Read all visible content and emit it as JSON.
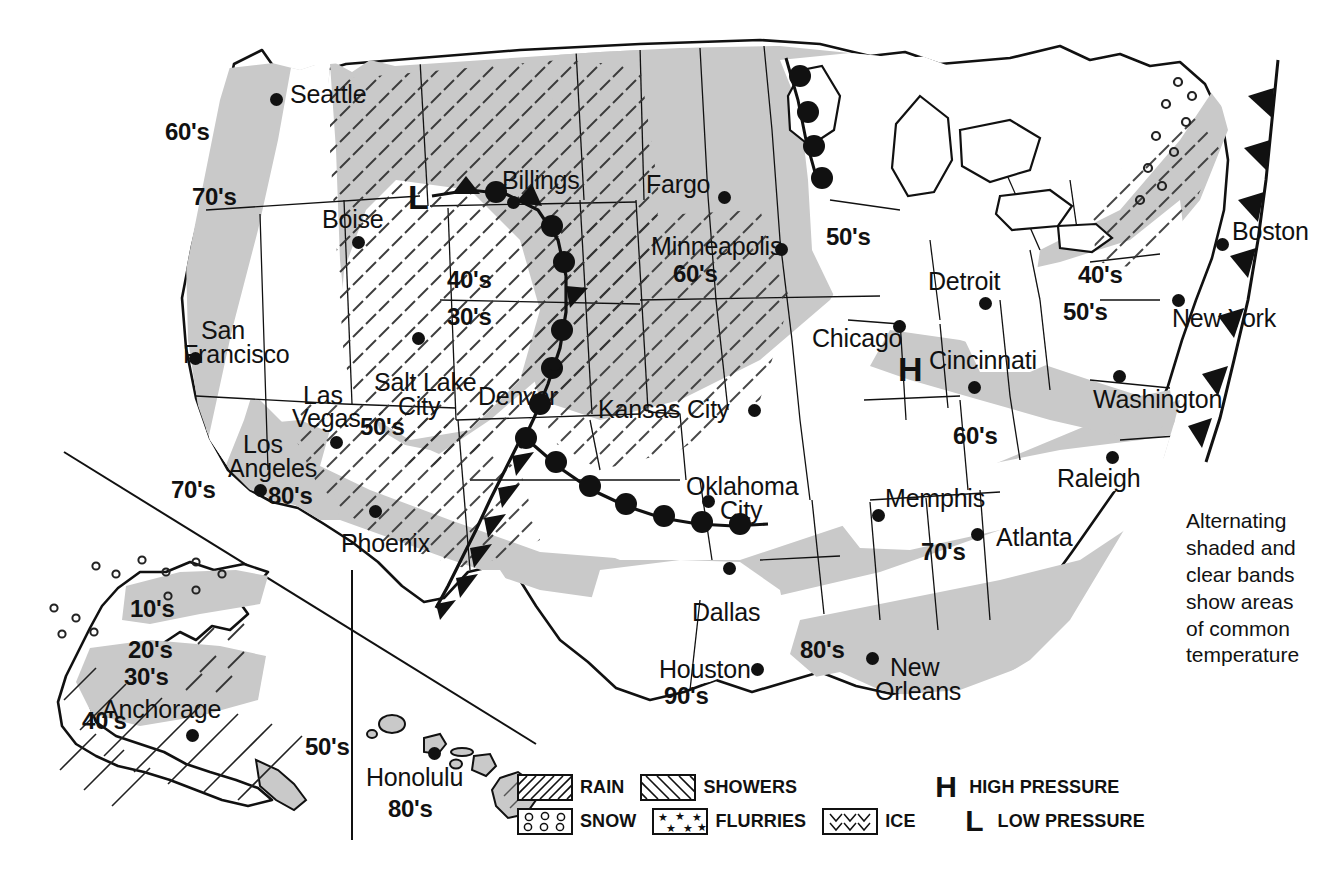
{
  "map": {
    "title": "USA Weather Map",
    "cities": [
      {
        "name": "Seattle",
        "label_x": 290,
        "label_y": 82,
        "dot_x": 270,
        "dot_y": 93
      },
      {
        "name": "Boise",
        "label_x": 322,
        "label_y": 207,
        "dot_x": 352,
        "dot_y": 236
      },
      {
        "name": "Billings",
        "label_x": 502,
        "label_y": 168,
        "dot_x": 507,
        "dot_y": 196
      },
      {
        "name": "Fargo",
        "label_x": 646,
        "label_y": 172,
        "dot_x": 718,
        "dot_y": 191
      },
      {
        "name": "Minneapolis",
        "label_x": 651,
        "label_y": 234,
        "dot_x": 775,
        "dot_y": 243
      },
      {
        "name": "Detroit",
        "label_x": 928,
        "label_y": 269,
        "dot_x": 979,
        "dot_y": 297
      },
      {
        "name": "Boston",
        "label_x": 1232,
        "label_y": 219,
        "dot_x": 1216,
        "dot_y": 238
      },
      {
        "name": "New York",
        "label_x": 1172,
        "label_y": 306,
        "dot_x": 1172,
        "dot_y": 294
      },
      {
        "name": "Chicago",
        "label_x": 812,
        "label_y": 326,
        "dot_x": 893,
        "dot_y": 320
      },
      {
        "name": "Cincinnati",
        "label_x": 929,
        "label_y": 348,
        "dot_x": 968,
        "dot_y": 381
      },
      {
        "name": "Washington",
        "label_x": 1093,
        "label_y": 387,
        "dot_x": 1113,
        "dot_y": 370
      },
      {
        "name": "San",
        "label_x": 201,
        "label_y": 318,
        "dot_x": 189,
        "dot_y": 352
      },
      {
        "name": "Francisco",
        "label_x": 183,
        "label_y": 342,
        "dot_x": null,
        "dot_y": null
      },
      {
        "name": "Salt Lake",
        "label_x": 374,
        "label_y": 370,
        "dot_x": 412,
        "dot_y": 332
      },
      {
        "name": "City",
        "label_x": 398,
        "label_y": 394,
        "dot_x": null,
        "dot_y": null
      },
      {
        "name": "Denver",
        "label_x": 478,
        "label_y": 384,
        "dot_x": 548,
        "dot_y": 358
      },
      {
        "name": "Kansas City",
        "label_x": 598,
        "label_y": 397,
        "dot_x": 748,
        "dot_y": 404
      },
      {
        "name": "Las",
        "label_x": 303,
        "label_y": 383,
        "dot_x": 330,
        "dot_y": 436
      },
      {
        "name": "Vegas",
        "label_x": 292,
        "label_y": 406,
        "dot_x": null,
        "dot_y": null
      },
      {
        "name": "Los",
        "label_x": 243,
        "label_y": 432,
        "dot_x": 254,
        "dot_y": 484
      },
      {
        "name": "Angeles",
        "label_x": 228,
        "label_y": 456,
        "dot_x": null,
        "dot_y": null
      },
      {
        "name": "Phoenix",
        "label_x": 341,
        "label_y": 531,
        "dot_x": 369,
        "dot_y": 505
      },
      {
        "name": "Oklahoma",
        "label_x": 686,
        "label_y": 474,
        "dot_x": 702,
        "dot_y": 495
      },
      {
        "name": "City",
        "label_x": 720,
        "label_y": 498,
        "dot_x": null,
        "dot_y": null
      },
      {
        "name": "Memphis",
        "label_x": 885,
        "label_y": 486,
        "dot_x": 872,
        "dot_y": 509
      },
      {
        "name": "Raleigh",
        "label_x": 1057,
        "label_y": 466,
        "dot_x": 1106,
        "dot_y": 451
      },
      {
        "name": "Atlanta",
        "label_x": 996,
        "label_y": 525,
        "dot_x": 971,
        "dot_y": 528
      },
      {
        "name": "Dallas",
        "label_x": 692,
        "label_y": 600,
        "dot_x": 723,
        "dot_y": 562
      },
      {
        "name": "Houston",
        "label_x": 659,
        "label_y": 657,
        "dot_x": 751,
        "dot_y": 663
      },
      {
        "name": "New",
        "label_x": 890,
        "label_y": 655,
        "dot_x": 866,
        "dot_y": 652
      },
      {
        "name": "Orleans",
        "label_x": 875,
        "label_y": 679,
        "dot_x": null,
        "dot_y": null
      },
      {
        "name": "Anchorage",
        "label_x": 102,
        "label_y": 697,
        "dot_x": 186,
        "dot_y": 729
      },
      {
        "name": "Honolulu",
        "label_x": 366,
        "label_y": 765,
        "dot_x": 428,
        "dot_y": 747
      }
    ],
    "temperature_bands": [
      {
        "value": "60's",
        "x": 165,
        "y": 120
      },
      {
        "value": "70's",
        "x": 192,
        "y": 185
      },
      {
        "value": "40's",
        "x": 447,
        "y": 268
      },
      {
        "value": "30's",
        "x": 447,
        "y": 305
      },
      {
        "value": "50's",
        "x": 826,
        "y": 225
      },
      {
        "value": "60's",
        "x": 673,
        "y": 262
      },
      {
        "value": "40's",
        "x": 1078,
        "y": 263
      },
      {
        "value": "50's",
        "x": 1063,
        "y": 300
      },
      {
        "value": "50's",
        "x": 360,
        "y": 415
      },
      {
        "value": "60's",
        "x": 953,
        "y": 424
      },
      {
        "value": "70's",
        "x": 171,
        "y": 478
      },
      {
        "value": "80's",
        "x": 268,
        "y": 484
      },
      {
        "value": "70's",
        "x": 921,
        "y": 540
      },
      {
        "value": "80's",
        "x": 800,
        "y": 638
      },
      {
        "value": "90's",
        "x": 664,
        "y": 684
      },
      {
        "value": "10's",
        "x": 130,
        "y": 597
      },
      {
        "value": "20's",
        "x": 128,
        "y": 638
      },
      {
        "value": "30's",
        "x": 124,
        "y": 665
      },
      {
        "value": "40's",
        "x": 82,
        "y": 709
      },
      {
        "value": "50's",
        "x": 305,
        "y": 735
      },
      {
        "value": "80's",
        "x": 388,
        "y": 797
      }
    ],
    "pressure_systems": [
      {
        "type": "L",
        "symbol": "L",
        "x": 408,
        "y": 180,
        "title": "Low pressure"
      },
      {
        "type": "H",
        "symbol": "H",
        "x": 898,
        "y": 352,
        "title": "High pressure"
      }
    ],
    "annotation": {
      "text": "Alternating\nshaded and\nclear bands\nshow areas\nof common\ntemperature",
      "x": 1186,
      "y": 508
    }
  },
  "legend": {
    "items": [
      {
        "id": "rain",
        "label": "RAIN",
        "pattern": "solid-diagonal"
      },
      {
        "id": "showers",
        "label": "SHOWERS",
        "pattern": "dashed-diagonal"
      },
      {
        "id": "snow",
        "label": "SNOW",
        "pattern": "circles"
      },
      {
        "id": "flurries",
        "label": "FLURRIES",
        "pattern": "stars"
      },
      {
        "id": "ice",
        "label": "ICE",
        "pattern": "chevrons"
      },
      {
        "id": "high",
        "label": "HIGH PRESSURE",
        "pattern": "glyph",
        "glyph": "H"
      },
      {
        "id": "low",
        "label": "LOW PRESSURE",
        "pattern": "glyph",
        "glyph": "L"
      }
    ]
  },
  "colors": {
    "shaded_band": "#c9c9c9",
    "clear_band": "#ffffff",
    "outline": "#111111",
    "text": "#111111",
    "background": "#ffffff"
  }
}
